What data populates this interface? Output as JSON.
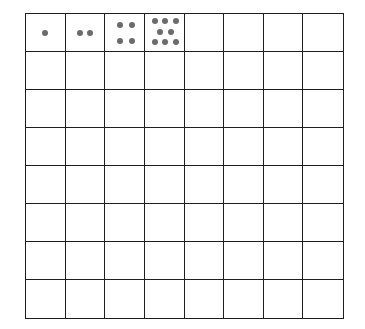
{
  "diagram": {
    "type": "grid",
    "rows": 8,
    "columns": 8,
    "line_color": "#1e1e1e",
    "dot_color": "#6b6b6b",
    "filled_cells": [
      {
        "row": 0,
        "col": 0,
        "dot_count": 1,
        "dots": [
          [
            0.5,
            0.5
          ]
        ]
      },
      {
        "row": 0,
        "col": 1,
        "dot_count": 2,
        "dots": [
          [
            0.38,
            0.5
          ],
          [
            0.62,
            0.5
          ]
        ]
      },
      {
        "row": 0,
        "col": 2,
        "dot_count": 4,
        "dots": [
          [
            0.38,
            0.3
          ],
          [
            0.68,
            0.3
          ],
          [
            0.38,
            0.72
          ],
          [
            0.68,
            0.72
          ]
        ]
      },
      {
        "row": 0,
        "col": 3,
        "dot_count": 8,
        "dots": [
          [
            0.25,
            0.2
          ],
          [
            0.53,
            0.2
          ],
          [
            0.8,
            0.2
          ],
          [
            0.4,
            0.48
          ],
          [
            0.68,
            0.48
          ],
          [
            0.25,
            0.76
          ],
          [
            0.53,
            0.76
          ],
          [
            0.8,
            0.76
          ]
        ]
      }
    ],
    "sequence": [
      1,
      2,
      4,
      8
    ]
  }
}
